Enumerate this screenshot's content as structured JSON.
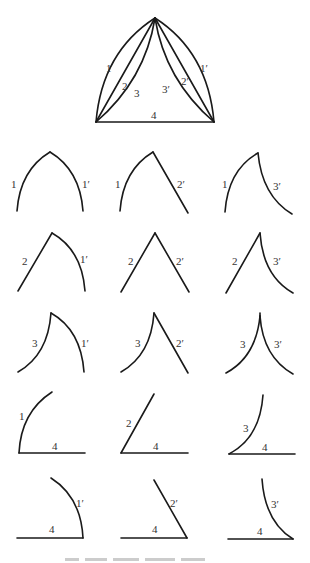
{
  "main_figure": {
    "name": "triangle-with-curved-sides",
    "curve_labels": [
      "1",
      "2",
      "3",
      "3′",
      "2′",
      "1′"
    ],
    "base_label": "4"
  },
  "grid": {
    "rows": [
      [
        {
          "left": "1",
          "right": "1′"
        },
        {
          "left": "1",
          "right": "2′"
        },
        {
          "left": "1",
          "right": "3′"
        }
      ],
      [
        {
          "left": "2",
          "right": "1′"
        },
        {
          "left": "2",
          "right": "2′"
        },
        {
          "left": "2",
          "right": "3′"
        }
      ],
      [
        {
          "left": "3",
          "right": "1′"
        },
        {
          "left": "3",
          "right": "2′"
        },
        {
          "left": "3",
          "right": "3′"
        }
      ],
      [
        {
          "side": "1",
          "base": "4"
        },
        {
          "side": "2",
          "base": "4"
        },
        {
          "side": "3",
          "base": "4"
        }
      ],
      [
        {
          "side": "1′",
          "base": "4"
        },
        {
          "side": "2′",
          "base": "4"
        },
        {
          "side": "3′",
          "base": "4"
        }
      ]
    ]
  }
}
